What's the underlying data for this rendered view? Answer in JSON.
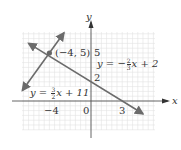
{
  "chart_data": {
    "type": "line",
    "title": "",
    "xlabel": "x",
    "ylabel": "y",
    "xlim": [
      -6,
      5
    ],
    "ylim": [
      -4,
      8
    ],
    "grid": true,
    "grid_step": 0.5,
    "x_ticks_labeled": [
      "-4",
      "0",
      "3"
    ],
    "y_ticks_labeled": [
      "5",
      "2"
    ],
    "series": [
      {
        "name": "y = -2/3 x + 2",
        "slope": -0.6667,
        "intercept": 2,
        "x": [
          -6,
          5
        ],
        "y": [
          6,
          -1.333
        ],
        "color": "#6b6b6b"
      },
      {
        "name": "y = 3/2 x + 11",
        "slope": 1.5,
        "intercept": 11,
        "x": [
          -6.6,
          -2.6
        ],
        "y": [
          1.1,
          7.1
        ],
        "color": "#6b6b6b"
      }
    ],
    "annotations": [
      {
        "text": "(-4, 5)",
        "x": -4,
        "y": 5,
        "type": "intersection-point"
      },
      {
        "text": "y = -2/3 x + 2"
      },
      {
        "text": "y = 3/2 x + 11"
      }
    ]
  },
  "labels": {
    "x_axis": "x",
    "y_axis": "y",
    "point": "(−4, 5)",
    "tick_neg4": "−4",
    "tick_0": "0",
    "tick_3": "3",
    "tick_5": "5",
    "tick_2": "2",
    "eq1": {
      "lhs": "y = −",
      "num": "2",
      "den": "3",
      "rhs": "x + 2"
    },
    "eq2": {
      "lhs": "y = ",
      "num": "3",
      "den": "2",
      "rhs": "x + 11"
    }
  }
}
